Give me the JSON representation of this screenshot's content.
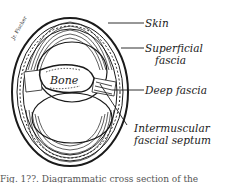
{
  "figure": {
    "type": "anatomical cross-section of a limb",
    "center_label": "Bone",
    "labels": [
      {
        "id": "skin",
        "text": "Skin"
      },
      {
        "id": "superficial_fascia_1",
        "text": "Superficial"
      },
      {
        "id": "superficial_fascia_2",
        "text": "fascia"
      },
      {
        "id": "deep_fascia",
        "text": "Deep fascia"
      },
      {
        "id": "septum_1",
        "text": "Intermuscular"
      },
      {
        "id": "septum_2",
        "text": "fascial septum"
      }
    ],
    "signature": "Jr. Fischer",
    "caption": "Fig. 1??. Diagrammatic cross section of the"
  },
  "colors": {
    "ink": "#1a1a1a",
    "paper": "#ffffff"
  }
}
